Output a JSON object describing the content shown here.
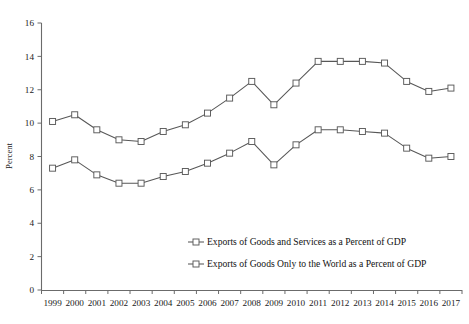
{
  "chart_data": {
    "type": "line",
    "title": "",
    "xlabel": "",
    "ylabel": "Percent",
    "ylim": [
      0,
      16
    ],
    "ytick_step": 2,
    "yticks": [
      0,
      2,
      4,
      6,
      8,
      10,
      12,
      14,
      16
    ],
    "grid": false,
    "legend_position": "inside-center-bottom",
    "marker": "open-square",
    "line_color": "#575757",
    "marker_fill": "#ffffff",
    "marker_edge": "#5a5a5a",
    "categories": [
      "1999",
      "2000",
      "2001",
      "2002",
      "2003",
      "2004",
      "2005",
      "2006",
      "2007",
      "2008",
      "2009",
      "2010",
      "2011",
      "2012",
      "2013",
      "2014",
      "2015",
      "2016",
      "2017"
    ],
    "x": [
      1999,
      2000,
      2001,
      2002,
      2003,
      2004,
      2005,
      2006,
      2007,
      2008,
      2009,
      2010,
      2011,
      2012,
      2013,
      2014,
      2015,
      2016,
      2017
    ],
    "series": [
      {
        "name": "Exports of Goods and Services as a Percent of GDP",
        "values": [
          10.1,
          10.5,
          9.6,
          9.0,
          8.9,
          9.5,
          9.9,
          10.6,
          11.5,
          12.5,
          11.1,
          12.4,
          13.7,
          13.7,
          13.7,
          13.6,
          12.5,
          11.9,
          12.1
        ]
      },
      {
        "name": "Exports of Goods Only to the World as a Percent of GDP",
        "values": [
          7.3,
          7.8,
          6.9,
          6.4,
          6.4,
          6.8,
          7.1,
          7.6,
          8.2,
          8.9,
          7.5,
          8.7,
          9.6,
          9.6,
          9.5,
          9.4,
          8.5,
          7.9,
          8.0
        ]
      }
    ]
  },
  "legend": {
    "items": [
      {
        "label": "Exports of Goods and Services as a Percent of GDP"
      },
      {
        "label": "Exports of Goods Only to the World as a Percent of GDP"
      }
    ]
  },
  "axes": {
    "y_title": "Percent",
    "y_tick_labels": [
      "0",
      "2",
      "4",
      "6",
      "8",
      "10",
      "12",
      "14",
      "16"
    ],
    "x_tick_labels": [
      "1999",
      "2000",
      "2001",
      "2002",
      "2003",
      "2004",
      "2005",
      "2006",
      "2007",
      "2008",
      "2009",
      "2010",
      "2011",
      "2012",
      "2013",
      "2014",
      "2015",
      "2016",
      "2017"
    ]
  }
}
